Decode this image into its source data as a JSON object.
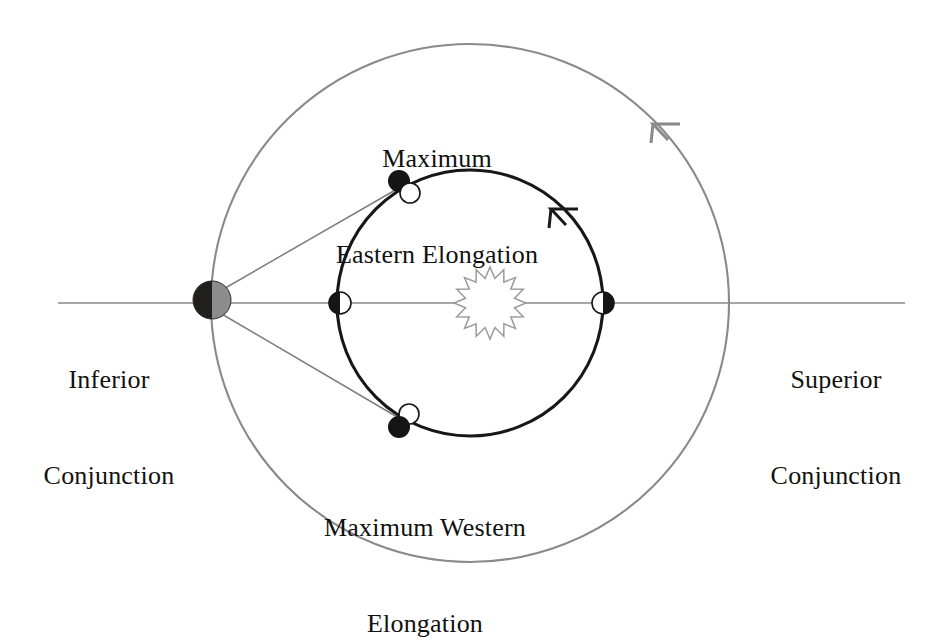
{
  "figure": {
    "background_color": "#ffffff"
  },
  "labels": {
    "maximum_eastern_elongation": {
      "line1": "Maximum",
      "line2": "Eastern Elongation"
    },
    "maximum_western_elongation": {
      "line1": "Maximum Western",
      "line2": "Elongation"
    },
    "inferior_conjunction": {
      "line1": "Inferior",
      "line2": "Conjunction"
    },
    "superior_conjunction": {
      "line1": "Superior",
      "line2": "Conjunction"
    }
  },
  "colors": {
    "outer_orbit_stroke": "#8a8a8a",
    "inner_orbit_stroke": "#171717",
    "sight_line_stroke": "#7d7d7d",
    "axis_line_stroke": "#8a8a8a",
    "earth_dark_half": "#221f1f",
    "earth_lit_half": "#8c8c8c",
    "planet_dark": "#151515",
    "planet_light": "#ffffff",
    "sun_stroke": "#9a9a9a",
    "sun_fill": "#ffffff",
    "text": "#111111"
  },
  "geometry": {
    "outer_orbit": {
      "cx": 470,
      "cy": 303,
      "r": 259,
      "label": "Earth orbit"
    },
    "inner_orbit": {
      "cx": 470,
      "cy": 303,
      "r": 133,
      "label": "Inferior planet orbit"
    },
    "sun": {
      "cx": 490,
      "cy": 303,
      "outer_r": 36,
      "inner_r": 25,
      "points": 16
    },
    "earth": {
      "cx": 212,
      "cy": 300,
      "r": 19
    }
  },
  "bodies": [
    {
      "name": "earth",
      "kind": "earth",
      "cx": 212,
      "cy": 300,
      "r": 19,
      "lit_side": "right",
      "caption": "Inferior Conjunction"
    },
    {
      "name": "planet-inferior-conjunction",
      "kind": "planet",
      "cx": 340,
      "cy": 303,
      "r": 11,
      "dark_side": "left",
      "phase": "new",
      "caption": "Inferior Conjunction"
    },
    {
      "name": "planet-superior-conjunction",
      "kind": "planet",
      "cx": 603,
      "cy": 303,
      "r": 11,
      "dark_side": "right",
      "phase": "full",
      "caption": "Superior Conjunction"
    },
    {
      "name": "planet-max-eastern-elongation",
      "kind": "planet",
      "cx": 403,
      "cy": 185,
      "r": 11,
      "dark_side": "upper-left",
      "phase": "half",
      "caption": "Maximum Eastern Elongation"
    },
    {
      "name": "planet-max-western-elongation",
      "kind": "planet",
      "cx": 403,
      "cy": 422,
      "r": 11,
      "dark_side": "lower-left",
      "phase": "half",
      "caption": "Maximum Western Elongation"
    }
  ],
  "sight_lines": [
    {
      "name": "earth-to-eastern-elongation",
      "x1": 222,
      "y1": 292,
      "x2": 400,
      "y2": 189
    },
    {
      "name": "earth-to-western-elongation",
      "x1": 222,
      "y1": 312,
      "x2": 400,
      "y2": 418
    },
    {
      "name": "horizontal-axis",
      "x1": 58,
      "y1": 303,
      "x2": 905,
      "y2": 303
    }
  ],
  "direction_arrows": [
    {
      "name": "inner-orbit-direction-arrow",
      "orbit": "inner",
      "angle_deg": 297,
      "direction": "counterclockwise"
    },
    {
      "name": "outer-orbit-direction-arrow",
      "orbit": "outer",
      "angle_deg": 312,
      "direction": "counterclockwise"
    }
  ]
}
